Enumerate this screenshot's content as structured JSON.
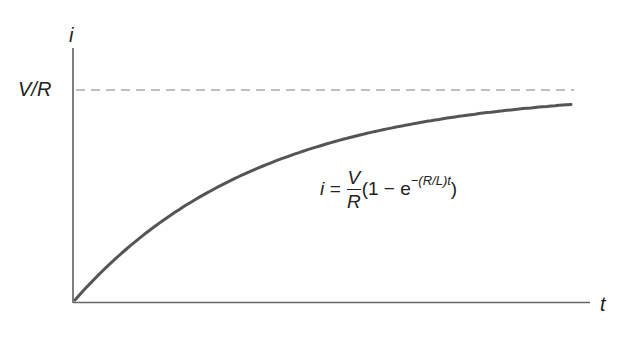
{
  "chart_data": {
    "type": "line",
    "title": "",
    "xlabel": "t",
    "ylabel": "i",
    "y_tick_labels": [
      "V/R"
    ],
    "asymptote": {
      "label": "V/R",
      "style": "dashed",
      "value": 1.0
    },
    "equation": "i = (V/R)(1 − e^(−(R/L)t))",
    "series": [
      {
        "name": "i(t)",
        "function": "1 - exp(-t/tau)",
        "x": [
          0,
          0.5,
          1,
          1.5,
          2,
          2.5,
          3
        ],
        "values": [
          0,
          0.39,
          0.63,
          0.78,
          0.86,
          0.92,
          0.95
        ]
      }
    ],
    "xlim": [
      0,
      3
    ],
    "ylim": [
      0,
      1.2
    ],
    "grid": false,
    "legend": "none"
  },
  "labels": {
    "y_axis": "i",
    "x_axis": "t",
    "asymptote": "V/R",
    "eq_lhs": "i =",
    "eq_num": "V",
    "eq_den": "R",
    "eq_paren_open": "(1 − e",
    "eq_exp": "−(R/L)t",
    "eq_paren_close": ")"
  },
  "colors": {
    "curve": "#555555",
    "axis": "#555555",
    "dashed": "#aaaaaa"
  }
}
